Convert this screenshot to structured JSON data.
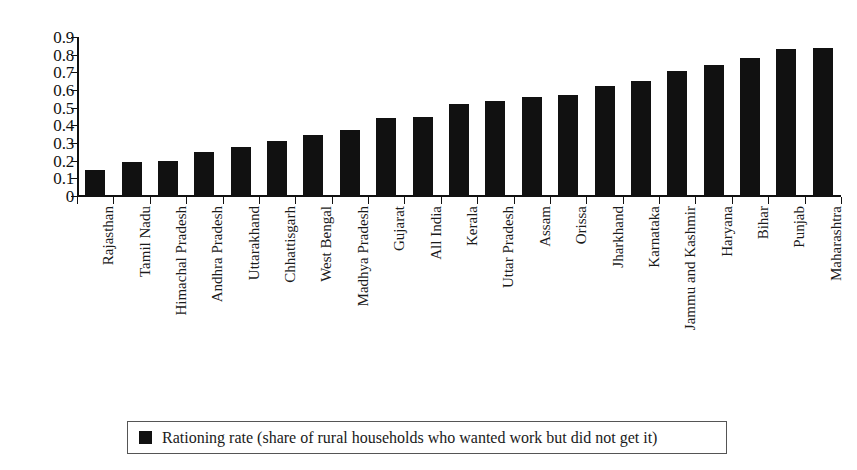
{
  "chart_data": {
    "type": "bar",
    "title": "",
    "xlabel": "",
    "ylabel": "",
    "ylim": [
      0,
      0.9
    ],
    "grid": false,
    "legend_position": "bottom",
    "bar_color": "#111111",
    "axis_color": "#111111",
    "y_ticks": [
      "0.9",
      "0.8",
      "0.7",
      "0.6",
      "0.5",
      "0.4",
      "0.3",
      "0.2",
      "0.1",
      "0"
    ],
    "y_tick_values": [
      0.9,
      0.8,
      0.7,
      0.6,
      0.5,
      0.4,
      0.3,
      0.2,
      0.1,
      0
    ],
    "categories": [
      "Rajasthan",
      "Tamil Nadu",
      "Himachal Pradesh",
      "Andhra Pradesh",
      "Uttarakhand",
      "Chhattisgarh",
      "West Bengal",
      "Madhya Pradesh",
      "Gujarat",
      "All India",
      "Kerala",
      "Uttar Pradesh",
      "Assam",
      "Orissa",
      "Jharkhand",
      "Karnataka",
      "Jammu and Kashmir",
      "Haryana",
      "Bihar",
      "Punjab",
      "Maharashtra"
    ],
    "values": [
      0.15,
      0.19,
      0.2,
      0.25,
      0.28,
      0.31,
      0.345,
      0.375,
      0.44,
      0.445,
      0.52,
      0.54,
      0.56,
      0.57,
      0.62,
      0.65,
      0.71,
      0.74,
      0.78,
      0.83,
      0.84
    ],
    "legend": [
      {
        "label": "Rationing rate (share of rural households who wanted work but did not get it)",
        "color": "#111111",
        "marker": "square"
      }
    ]
  }
}
